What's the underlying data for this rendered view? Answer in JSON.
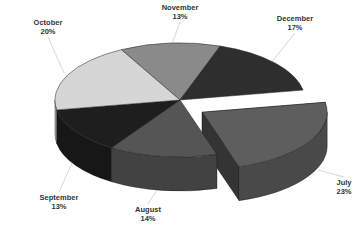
{
  "chart_data": {
    "type": "pie",
    "style": "3d-exploded",
    "title": "",
    "slices": [
      {
        "label": "November",
        "value": 13,
        "pct_label": "13%",
        "color": "#8a8a8a",
        "exploded": false
      },
      {
        "label": "December",
        "value": 17,
        "pct_label": "17%",
        "color": "#2e2e2e",
        "exploded": false
      },
      {
        "label": "July",
        "value": 23,
        "pct_label": "23%",
        "color": "#5e5e5e",
        "exploded": true
      },
      {
        "label": "August",
        "value": 14,
        "pct_label": "14%",
        "color": "#555555",
        "exploded": false
      },
      {
        "label": "September",
        "value": 13,
        "pct_label": "13%",
        "color": "#1e1e1e",
        "exploded": false
      },
      {
        "label": "October",
        "value": 20,
        "pct_label": "20%",
        "color": "#d6d6d6",
        "exploded": false
      }
    ],
    "legend": "none"
  }
}
